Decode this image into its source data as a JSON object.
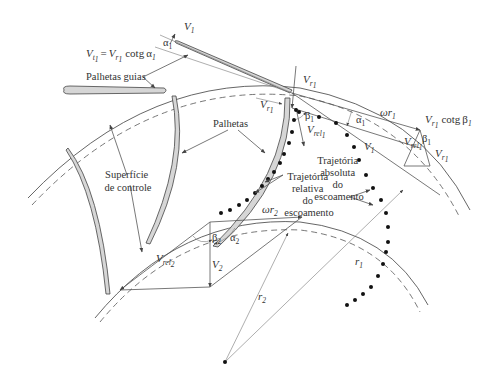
{
  "figure": {
    "language": "pt-BR"
  },
  "labels": {
    "guide_vanes": "Palhetas guias",
    "blades": "Palhetas",
    "control_surface_line1": "Superfície",
    "control_surface_line2": "de controle",
    "relative_traj_line1": "Trajetória",
    "relative_traj_line2": "relativa",
    "relative_traj_line3": "do",
    "relative_traj_line4": "escoamento",
    "absolute_traj_line1": "Trajetória",
    "absolute_traj_line2": "absoluta",
    "absolute_traj_line3": "do",
    "absolute_traj_line4": "escoamento"
  },
  "symbols": {
    "V": "V",
    "t1": "t",
    "r1": "r",
    "sub1": "1",
    "sub2": "2",
    "rel": "rel",
    "eq": "=",
    "cotg": "cotg",
    "alpha": "α",
    "beta": "β",
    "omega_r": "ωr",
    "r": "r"
  },
  "equations": {
    "inlet_tangential": "V_t1 = V_r1 cotg α1",
    "inlet_blade_tangential": "V_r1 cotg β1"
  },
  "vectors": {
    "inlet": [
      "V1",
      "Vr1",
      "Vrel1",
      "ωr1",
      "Vt1"
    ],
    "outlet": [
      "V2",
      "Vrel2",
      "ωr2"
    ],
    "radii": [
      "r1",
      "r2"
    ],
    "angles": [
      "α1",
      "β1",
      "α2",
      "β2"
    ]
  }
}
